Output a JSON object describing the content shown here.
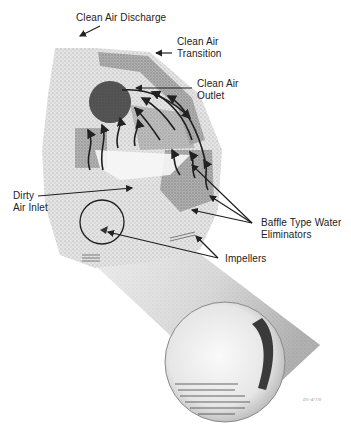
{
  "diagram": {
    "type": "cutaway equipment illustration",
    "labels": {
      "clean_air_discharge": "Clean Air Discharge",
      "clean_air_transition_line1": "Clean Air",
      "clean_air_transition_line2": "Transition",
      "clean_air_outlet_line1": "Clean Air",
      "clean_air_outlet_line2": "Outlet",
      "dirty_air_inlet_line1": "Dirty",
      "dirty_air_inlet_line2": "Air Inlet",
      "baffle_line1": "Baffle Type Water",
      "baffle_line2": "Eliminators",
      "impellers": "Impellers"
    },
    "stamp": "D1-4/7/0",
    "colors": {
      "ink": "#222222",
      "housing_light": "#d9d9d9",
      "housing_mid": "#a8a8a8",
      "housing_dark": "#6e6e6e",
      "outlet": "#3a3a3a",
      "background": "#ffffff"
    }
  }
}
